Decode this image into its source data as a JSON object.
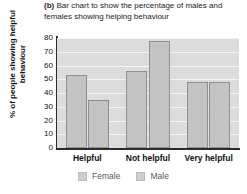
{
  "chart_data": {
    "type": "bar",
    "title": "Bar chart to show the percentage of males and females showing helping behaviour",
    "title_label": "(b)",
    "categories": [
      "Helpful",
      "Not helpful",
      "Very helpful"
    ],
    "series": [
      {
        "name": "Female",
        "values": [
          53,
          56,
          48
        ],
        "color": "#c3c3c3"
      },
      {
        "name": "Male",
        "values": [
          35,
          78,
          48
        ],
        "color": "#c3c3c3"
      }
    ],
    "xlabel": "",
    "ylabel": "% of people showing helpful behaviour",
    "ylim": [
      0,
      80
    ],
    "yticks": [
      80,
      70,
      60,
      50,
      40,
      30,
      20,
      10,
      0
    ],
    "grid": true,
    "legend_position": "bottom",
    "plot_background": "#dcdcdc",
    "gridline_color": "#f4f4f4",
    "axis_color": "#2b2b2b"
  }
}
